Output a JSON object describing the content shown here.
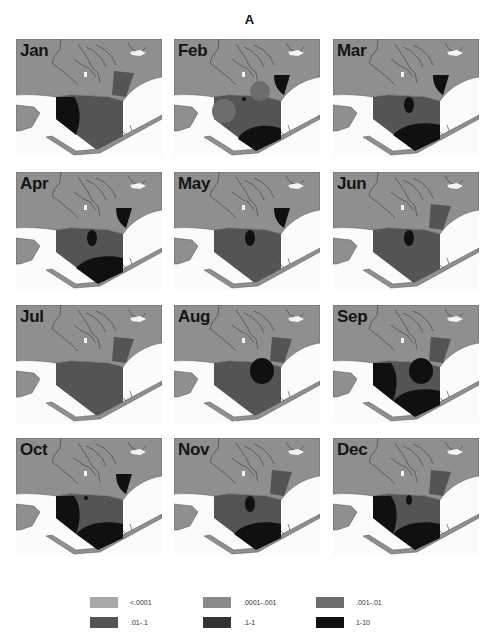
{
  "figure": {
    "title": "A"
  },
  "colors": {
    "land": "#8f8f8f",
    "water": "#fbfbfb",
    "shore": "#3a3a3a",
    "class_0": "#a8a8a8",
    "class_1": "#8a8a8a",
    "class_2": "#6d6d6d",
    "class_3": "#545454",
    "class_4": "#333333",
    "class_5": "#101010"
  },
  "panels": [
    {
      "month": "Jan"
    },
    {
      "month": "Feb"
    },
    {
      "month": "Mar"
    },
    {
      "month": "Apr"
    },
    {
      "month": "May"
    },
    {
      "month": "Jun"
    },
    {
      "month": "Jul"
    },
    {
      "month": "Aug"
    },
    {
      "month": "Sep"
    },
    {
      "month": "Oct"
    },
    {
      "month": "Nov"
    },
    {
      "month": "Dec"
    }
  ],
  "legend": {
    "items": [
      {
        "label": "<.0001",
        "color": "#a8a8a8"
      },
      {
        "label": ".0001-.001",
        "color": "#8a8a8a"
      },
      {
        "label": ".001-.01",
        "color": "#6d6d6d"
      },
      {
        "label": ".01-.1",
        "color": "#545454"
      },
      {
        "label": ".1-1",
        "color": "#333333"
      },
      {
        "label": "1-10",
        "color": "#101010"
      }
    ]
  },
  "chart_data": {
    "type": "heatmap",
    "title": "A",
    "panels": [
      "Jan",
      "Feb",
      "Mar",
      "Apr",
      "May",
      "Jun",
      "Jul",
      "Aug",
      "Sep",
      "Oct",
      "Nov",
      "Dec"
    ],
    "legend": [
      "<.0001",
      ".0001-.001",
      ".001-.01",
      ".01-.1",
      ".1-1",
      "1-10"
    ],
    "dominant_class_by_month": {
      "Jan": ".01-.1",
      "Feb": ".01-.1",
      "Mar": ".01-.1",
      "Apr": ".01-.1",
      "May": ".01-.1",
      "Jun": ".01-.1",
      "Jul": ".01-.1",
      "Aug": ".01-.1",
      "Sep": ".01-.1",
      "Oct": ".01-.1",
      "Nov": ".01-.1",
      "Dec": ".01-.1"
    },
    "high_class_patches": {
      "Jan": [
        "west lobe 1-10"
      ],
      "Feb": [
        "south lobe 1-10",
        "northeast inlet 1-10",
        "central .001-.01 patches"
      ],
      "Mar": [
        "south lobe 1-10",
        "central spot .1-1",
        "northeast inlet 1-10"
      ],
      "Apr": [
        "south lobe 1-10",
        "central spot 1-10",
        "northeast inlet 1-10"
      ],
      "May": [
        "central spot 1-10",
        "northeast inlet 1-10"
      ],
      "Jun": [
        "central spot 1-10"
      ],
      "Jul": [],
      "Aug": [
        "central-east circle 1-10"
      ],
      "Sep": [
        "central-east circle 1-10",
        "west lobe 1-10",
        "south lobe 1-10"
      ],
      "Oct": [
        "west lobe 1-10",
        "south lobe 1-10",
        "northeast inlet 1-10",
        "small central spot 1-10"
      ],
      "Nov": [
        "south lobe 1-10",
        "central spot 1-10"
      ],
      "Dec": [
        "west lobe 1-10",
        "south lobe 1-10",
        "small central spot 1-10"
      ]
    },
    "layout": {
      "rows": 4,
      "cols": 3,
      "legend_position": "bottom"
    }
  }
}
